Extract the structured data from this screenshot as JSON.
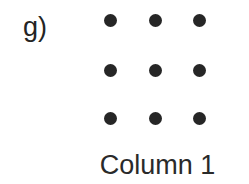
{
  "figure": {
    "panel_label": "g)",
    "caption": "Column 1",
    "background_color": "#ffffff",
    "dot_color": "#262626",
    "text_color": "#242424"
  },
  "chart_data": {
    "type": "scatter",
    "title": "",
    "subtitle": "",
    "xlabel": "Column 1",
    "ylabel": "",
    "annotations": [
      "g)"
    ],
    "legend": [],
    "grid": false,
    "n_rows": 3,
    "n_cols": 3,
    "marker": "filled-circle",
    "marker_color": "#262626",
    "marker_size_px": 13,
    "col_centers_px": [
      110,
      155,
      199
    ],
    "row_centers_px": [
      20,
      70,
      118
    ],
    "points": [
      {
        "row": 1,
        "col": 1,
        "x": 110,
        "y": 20
      },
      {
        "row": 1,
        "col": 2,
        "x": 155,
        "y": 20
      },
      {
        "row": 1,
        "col": 3,
        "x": 199,
        "y": 20
      },
      {
        "row": 2,
        "col": 1,
        "x": 110,
        "y": 70
      },
      {
        "row": 2,
        "col": 2,
        "x": 155,
        "y": 70
      },
      {
        "row": 2,
        "col": 3,
        "x": 199,
        "y": 70
      },
      {
        "row": 3,
        "col": 1,
        "x": 110,
        "y": 118
      },
      {
        "row": 3,
        "col": 2,
        "x": 155,
        "y": 118
      },
      {
        "row": 3,
        "col": 3,
        "x": 199,
        "y": 118
      }
    ]
  }
}
